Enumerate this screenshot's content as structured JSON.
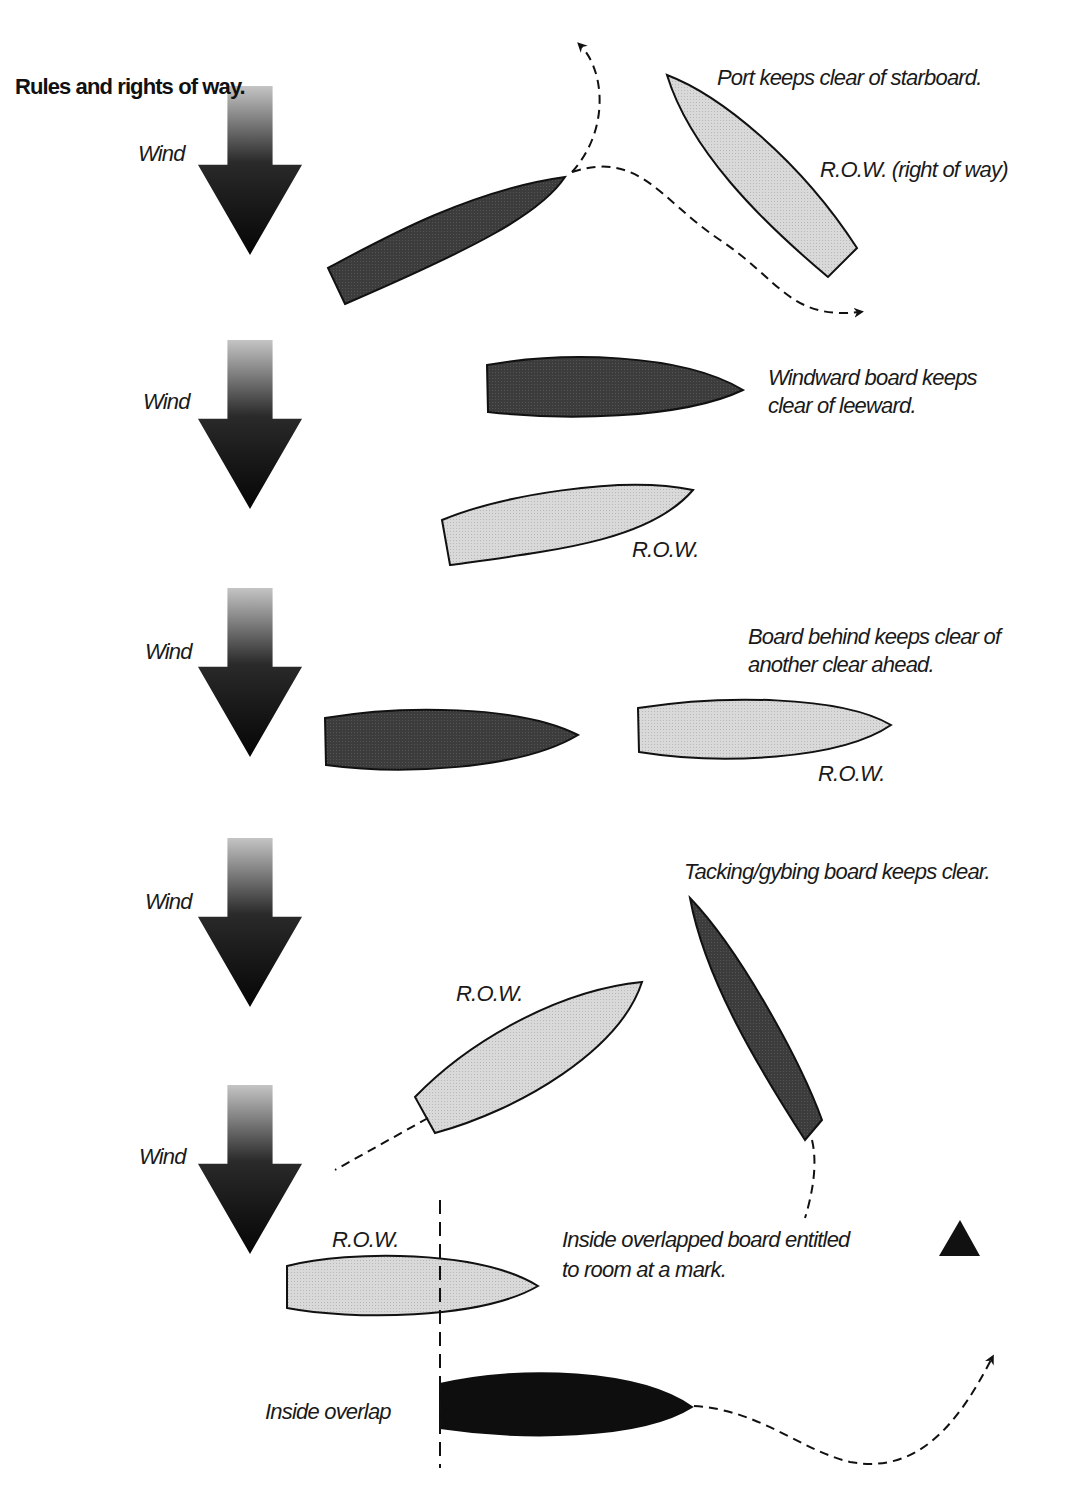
{
  "page": {
    "title": "Rules and rights of way."
  },
  "colors": {
    "background": "#ffffff",
    "dark_board": "#3a3a3a",
    "light_board": "#d6d6d6",
    "black_board": "#0e0e0e",
    "outline": "#111111",
    "wind_arrow_top": "#bdbdbd",
    "wind_arrow_bottom": "#0a0a0a",
    "mark": "#111111"
  },
  "wind_label": "Wind",
  "sections": [
    {
      "id": "port-starboard",
      "wind_label": "Wind",
      "rule": "Port keeps clear of starboard.",
      "row_label": "R.O.W. (right of way)"
    },
    {
      "id": "windward-leeward",
      "wind_label": "Wind",
      "rule_line1": "Windward board keeps",
      "rule_line2": "clear of leeward.",
      "row_label": "R.O.W."
    },
    {
      "id": "clear-ahead",
      "wind_label": "Wind",
      "rule_line1": "Board behind keeps clear of",
      "rule_line2": "another clear ahead.",
      "row_label": "R.O.W."
    },
    {
      "id": "tacking-gybing",
      "wind_label": "Wind",
      "rule": "Tacking/gybing board keeps clear.",
      "row_label": "R.O.W."
    },
    {
      "id": "inside-overlap",
      "wind_label": "Wind",
      "rule_line1": "Inside overlapped board entitled",
      "rule_line2": "to room at a mark.",
      "row_label": "R.O.W.",
      "overlap_label": "Inside overlap"
    }
  ]
}
